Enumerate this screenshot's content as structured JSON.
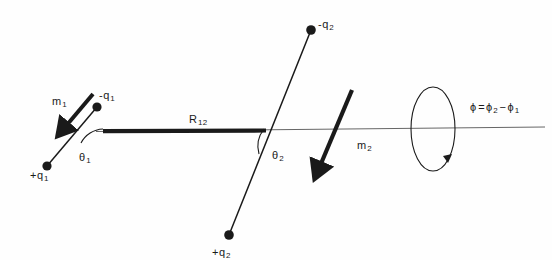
{
  "figure": {
    "background_color": "#fefefe",
    "ink_color": "#1a1a1a",
    "axis_color": "#555555",
    "width": 552,
    "height": 260
  },
  "labels": {
    "m1": {
      "base": "m",
      "sub": "1"
    },
    "mq1": {
      "sign": "-",
      "base": "q",
      "sub": "1"
    },
    "pq1": {
      "sign": "+",
      "base": "q",
      "sub": "1"
    },
    "th1": {
      "base": "θ",
      "sub": "1"
    },
    "R12": {
      "base": "R",
      "sub": "12"
    },
    "mq2": {
      "sign": "-",
      "base": "q",
      "sub": "2"
    },
    "pq2": {
      "sign": "+",
      "base": "q",
      "sub": "2"
    },
    "th2": {
      "base": "θ",
      "sub": "2"
    },
    "m2": {
      "base": "m",
      "sub": "2"
    },
    "phi": {
      "lhs": "ϕ",
      "equals": "=",
      "term1_base": "ϕ",
      "term1_sub": "2",
      "minus": "−",
      "term2_base": "ϕ",
      "term2_sub": "1"
    }
  },
  "elements": {
    "charges": [
      {
        "name": "minus-q1",
        "x": 97,
        "y": 107
      },
      {
        "name": "plus-q1",
        "x": 47,
        "y": 166
      },
      {
        "name": "minus-q2",
        "x": 311,
        "y": 30
      },
      {
        "name": "plus-q2",
        "x": 229,
        "y": 235
      }
    ],
    "separation_bar": {
      "x1": 103,
      "y1": 131,
      "x2": 266,
      "y2": 131,
      "thickness": 4
    },
    "axis_line": {
      "x1": 96,
      "y1": 131,
      "x2": 545,
      "y2": 127
    },
    "rotation_ellipse": {
      "cx": 433,
      "cy": 129,
      "rx": 22,
      "ry": 42
    },
    "moment_arrow_1": {
      "x1": 93,
      "y1": 94,
      "x2": 62,
      "y2": 130
    },
    "moment_arrow_2": {
      "x1": 350,
      "y1": 92,
      "x2": 315,
      "y2": 172
    }
  }
}
